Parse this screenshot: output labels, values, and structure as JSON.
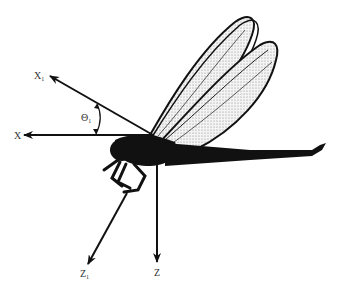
{
  "figure": {
    "axes": [
      {
        "id": "X",
        "label": "X",
        "subscript": ""
      },
      {
        "id": "X1",
        "label": "X",
        "subscript": "1"
      },
      {
        "id": "Z",
        "label": "Z",
        "subscript": ""
      },
      {
        "id": "Z1",
        "label": "Z",
        "subscript": "1"
      }
    ],
    "angle": {
      "label": "Θ",
      "subscript": "1"
    },
    "colors": {
      "ink": "#111111",
      "wing_fill": "#e9e9e9",
      "label": "#333333"
    }
  }
}
